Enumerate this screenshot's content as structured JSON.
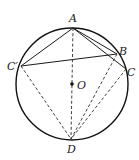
{
  "diagram": {
    "type": "circle-geometry",
    "circle": {
      "center": "O",
      "cx": 72,
      "cy": 84,
      "r": 56
    },
    "points": {
      "A": {
        "label": "A",
        "x": 73,
        "y": 28
      },
      "B": {
        "label": "B",
        "x": 117,
        "y": 54
      },
      "C": {
        "label": "C",
        "x": 126,
        "y": 69
      },
      "Cp": {
        "label": "C′",
        "x": 21,
        "y": 66
      },
      "D": {
        "label": "D",
        "x": 71,
        "y": 139
      },
      "O": {
        "label": "O",
        "x": 72,
        "y": 84
      }
    },
    "solid_segments": [
      [
        "A",
        "Cp"
      ],
      [
        "A",
        "B"
      ],
      [
        "A",
        "C"
      ],
      [
        "Cp",
        "B"
      ]
    ],
    "dashed_segments": [
      [
        "A",
        "D"
      ],
      [
        "Cp",
        "D"
      ],
      [
        "B",
        "D"
      ],
      [
        "C",
        "D"
      ]
    ],
    "colors": {
      "stroke": "#1a1a1a",
      "background": "#ffffff"
    }
  }
}
